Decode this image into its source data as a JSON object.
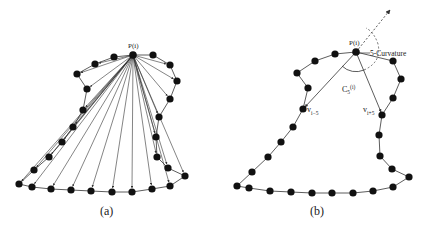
{
  "figure": {
    "panel_a": {
      "caption": "(a)",
      "center_label": "P(i)",
      "center": [
        133,
        55
      ],
      "points": [
        [
          153,
          55
        ],
        [
          170,
          65
        ],
        [
          177,
          81
        ],
        [
          170,
          99
        ],
        [
          159,
          117
        ],
        [
          156,
          137
        ],
        [
          157,
          157
        ],
        [
          168,
          168
        ],
        [
          185,
          176
        ],
        [
          170,
          186
        ],
        [
          152,
          189
        ],
        [
          132,
          192
        ],
        [
          112,
          192
        ],
        [
          91,
          191
        ],
        [
          71,
          190
        ],
        [
          51,
          189
        ],
        [
          32,
          187
        ],
        [
          19,
          184
        ],
        [
          34,
          170
        ],
        [
          49,
          157
        ],
        [
          62,
          142
        ],
        [
          73,
          127
        ],
        [
          83,
          110
        ],
        [
          87,
          89
        ],
        [
          77,
          74
        ],
        [
          95,
          64
        ],
        [
          114,
          57
        ]
      ]
    },
    "panel_b": {
      "caption": "(b)",
      "center_label": "P(i)",
      "curvature_label": "5-Curvature",
      "angle_label_main": "C",
      "angle_label_sub": "5",
      "angle_label_sup": "(i)",
      "v_minus_label_main": "v",
      "v_minus_label_sub": "i−5",
      "v_plus_label_main": "v",
      "v_plus_label_sub": "i+5",
      "center": [
        356,
        52
      ],
      "v_minus": [
        303,
        109
      ],
      "v_plus": [
        382,
        115
      ],
      "points": [
        [
          393,
          61
        ],
        [
          401,
          79
        ],
        [
          393,
          98
        ],
        [
          382,
          115
        ],
        [
          379,
          135
        ],
        [
          380,
          156
        ],
        [
          392,
          169
        ],
        [
          409,
          177
        ],
        [
          393,
          187
        ],
        [
          373,
          191
        ],
        [
          353,
          193
        ],
        [
          332,
          193
        ],
        [
          312,
          193
        ],
        [
          291,
          192
        ],
        [
          270,
          191
        ],
        [
          249,
          188
        ],
        [
          237,
          186
        ],
        [
          252,
          172
        ],
        [
          268,
          157
        ],
        [
          281,
          142
        ],
        [
          293,
          127
        ],
        [
          303,
          109
        ],
        [
          308,
          88
        ],
        [
          297,
          73
        ],
        [
          315,
          61
        ],
        [
          335,
          54
        ]
      ]
    },
    "colors": {
      "stroke": "#333333",
      "point": "#111111",
      "background": "#ffffff"
    }
  }
}
